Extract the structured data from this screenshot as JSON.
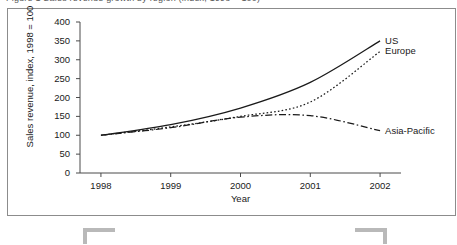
{
  "figure": {
    "top_text_remnant": "Figure 1  Sales revenue growth by region (index, 1998 = 100)"
  },
  "chart_data": {
    "type": "line",
    "title": "",
    "xlabel": "Year",
    "ylabel": "Sales revenue, index, 1998 = 100",
    "x": [
      1998,
      1999,
      2000,
      2001,
      2002
    ],
    "xtick_labels": [
      "1998",
      "1999",
      "2000",
      "2001",
      "2002"
    ],
    "ytick_labels": [
      "0",
      "50",
      "100",
      "150",
      "200",
      "250",
      "300",
      "350",
      "400"
    ],
    "ytick_values": [
      0,
      50,
      100,
      150,
      200,
      250,
      300,
      350,
      400
    ],
    "xlim": [
      1997.7,
      2002.3
    ],
    "ylim": [
      0,
      400
    ],
    "grid": false,
    "legend_position": "right-inline-labels",
    "series": [
      {
        "name": "US",
        "label": "US",
        "linestyle": "solid",
        "color": "#1a1a1a",
        "values": [
          100,
          128,
          172,
          240,
          350
        ]
      },
      {
        "name": "Europe",
        "label": "Europe",
        "linestyle": "dotted",
        "color": "#1a1a1a",
        "values": [
          100,
          122,
          150,
          188,
          322
        ]
      },
      {
        "name": "Asia-Pacific",
        "label": "Asia-Pacific",
        "linestyle": "dash-dot",
        "color": "#1a1a1a",
        "values": [
          100,
          120,
          148,
          152,
          112
        ]
      }
    ]
  },
  "marks": {
    "crop_mark_left": "crop-mark",
    "crop_mark_right": "crop-mark"
  }
}
